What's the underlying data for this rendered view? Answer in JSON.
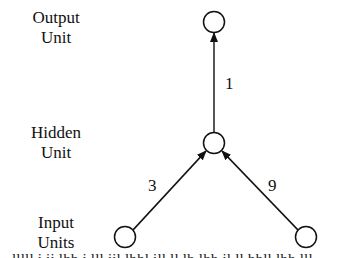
{
  "diagram": {
    "labels": {
      "output": [
        "Output",
        "Unit"
      ],
      "hidden": [
        "Hidden",
        "Unit"
      ],
      "input": [
        "Input",
        "Units"
      ]
    },
    "weights": {
      "hidden_to_output": "1",
      "input_left_to_hidden": "3",
      "input_right_to_hidden": "9"
    },
    "nodes": [
      {
        "id": "output",
        "cx": 214,
        "cy": 22
      },
      {
        "id": "hidden",
        "cx": 214,
        "cy": 143
      },
      {
        "id": "input_left",
        "cx": 125,
        "cy": 237
      },
      {
        "id": "input_right",
        "cx": 306,
        "cy": 237
      }
    ],
    "caption_fragment": "..."
  }
}
